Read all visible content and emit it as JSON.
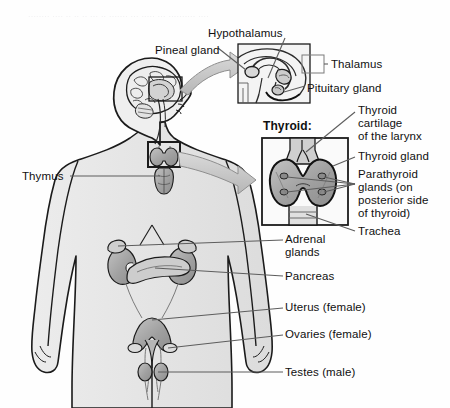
{
  "figure": {
    "faint_header": "........ .... .. .. .. ... .. ....... ... ..... ... .......... ....",
    "background_color": "#fefefe",
    "body_fill": "#e9e9e9",
    "organ_fill": "#9a9a9a",
    "organ_fill_light": "#bdbdbd",
    "outline_color": "#1a1a1a",
    "leader_color": "#6e6e6e",
    "arrow_fill": "#c9c9c9"
  },
  "insets": {
    "brain": {
      "name": "brain-inset",
      "x": 238,
      "y": 44,
      "w": 72,
      "h": 59
    },
    "thyroid": {
      "name": "thyroid-inset",
      "label": "Thyroid:",
      "x": 262,
      "y": 138,
      "w": 86,
      "h": 87
    },
    "neck_box": {
      "x": 148,
      "y": 142,
      "w": 32,
      "h": 25
    },
    "head_box": {
      "x": 149,
      "y": 77,
      "w": 33,
      "h": 24
    },
    "thalamus_box": {
      "x": 302,
      "y": 55,
      "w": 22,
      "h": 18
    }
  },
  "labels": [
    {
      "id": "hypothalamus",
      "text": "Hypothalamus",
      "x": 208,
      "y": 27,
      "align": "left"
    },
    {
      "id": "pineal-gland",
      "text": "Pineal gland",
      "x": 155,
      "y": 44,
      "align": "left"
    },
    {
      "id": "thalamus",
      "text": "Thalamus",
      "x": 331,
      "y": 58,
      "align": "left"
    },
    {
      "id": "pituitary-gland",
      "text": "Pituitary gland",
      "x": 307,
      "y": 82,
      "align": "left"
    },
    {
      "id": "thyroid-cartilage",
      "text": "Thyroid\ncartilage\nof the larynx",
      "x": 358,
      "y": 106,
      "align": "left"
    },
    {
      "id": "thyroid-gland",
      "text": "Thyroid gland",
      "x": 358,
      "y": 152,
      "align": "left"
    },
    {
      "id": "parathyroid-glands",
      "text": "Parathyroid\nglands (on\nposterior side\nof thyroid)",
      "x": 358,
      "y": 171,
      "align": "left"
    },
    {
      "id": "trachea",
      "text": "Trachea",
      "x": 358,
      "y": 229,
      "align": "left"
    },
    {
      "id": "thymus",
      "text": "Thymus",
      "x": 22,
      "y": 170,
      "align": "left"
    },
    {
      "id": "adrenal-glands",
      "text": "Adrenal\nglands",
      "x": 285,
      "y": 235,
      "align": "left"
    },
    {
      "id": "pancreas",
      "text": "Pancreas",
      "x": 285,
      "y": 272,
      "align": "left"
    },
    {
      "id": "uterus-female",
      "text": "Uterus (female)",
      "x": 285,
      "y": 303,
      "align": "left"
    },
    {
      "id": "ovaries-female",
      "text": "Ovaries (female)",
      "x": 285,
      "y": 330,
      "align": "left"
    },
    {
      "id": "testes-male",
      "text": "Testes (male)",
      "x": 285,
      "y": 368,
      "align": "left"
    }
  ],
  "anatomy_parts": [
    "head-profile",
    "brain",
    "thyroid-gland-neck",
    "thymus-gland",
    "kidneys",
    "adrenal-glands",
    "pancreas",
    "uterus",
    "ovaries",
    "testes",
    "body-silhouette"
  ]
}
